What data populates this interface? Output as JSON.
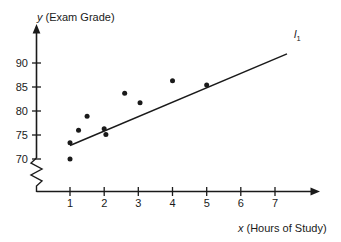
{
  "chart_data": {
    "type": "scatter",
    "title": "",
    "xlabel": "x (Hours of Study)",
    "xlabel_var": "x",
    "xlabel_text": "(Hours of Study)",
    "ylabel": "y (Exam Grade)",
    "ylabel_var": "y",
    "ylabel_text": "(Exam Grade)",
    "xlim": [
      0,
      7.6
    ],
    "ylim": [
      68.5,
      92.5
    ],
    "y_axis_break": true,
    "grid": false,
    "legend": "none",
    "xticks": [
      1,
      2,
      3,
      4,
      5,
      6,
      7
    ],
    "xtick_labels": [
      "1",
      "2",
      "3",
      "4",
      "5",
      "6",
      "7"
    ],
    "yticks": [
      70,
      75,
      80,
      85,
      90
    ],
    "ytick_labels": [
      "70",
      "75",
      "80",
      "85",
      "90"
    ],
    "points": [
      {
        "x": 1.0,
        "y": 70.0
      },
      {
        "x": 1.0,
        "y": 73.4
      },
      {
        "x": 1.25,
        "y": 76.0
      },
      {
        "x": 1.5,
        "y": 78.9
      },
      {
        "x": 2.0,
        "y": 76.3
      },
      {
        "x": 2.05,
        "y": 75.1
      },
      {
        "x": 2.6,
        "y": 83.7
      },
      {
        "x": 3.05,
        "y": 81.7
      },
      {
        "x": 4.0,
        "y": 86.3
      },
      {
        "x": 5.0,
        "y": 85.4
      }
    ],
    "trend_line": {
      "label": "l",
      "label_subscript": "1",
      "label_full": "l₁",
      "start": {
        "x": 1.0,
        "y": 72.8
      },
      "end": {
        "x": 7.35,
        "y": 91.9
      }
    }
  }
}
